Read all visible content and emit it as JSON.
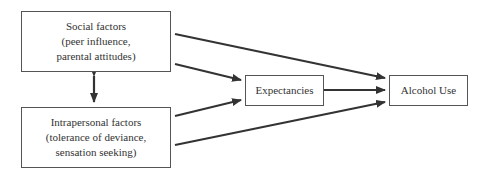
{
  "nodes": {
    "social": {
      "title": "Social factors",
      "line2": "(peer influence,",
      "line3": "parental attitudes)"
    },
    "intrapersonal": {
      "title": "Intrapersonal factors",
      "line2": "(tolerance of deviance,",
      "line3": "sensation seeking)"
    },
    "expectancies": {
      "label": "Expectancies"
    },
    "alcohol_use": {
      "label": "Alcohol Use"
    }
  },
  "edges": [
    {
      "from": "social",
      "to": "alcohol_use",
      "type": "directed"
    },
    {
      "from": "social",
      "to": "expectancies",
      "type": "directed"
    },
    {
      "from": "intrapersonal",
      "to": "expectancies",
      "type": "directed"
    },
    {
      "from": "intrapersonal",
      "to": "alcohol_use",
      "type": "directed"
    },
    {
      "from": "expectancies",
      "to": "alcohol_use",
      "type": "directed"
    },
    {
      "from": "social",
      "to": "intrapersonal",
      "type": "bidirectional"
    }
  ],
  "colors": {
    "line": "#333333",
    "border": "#555555"
  }
}
